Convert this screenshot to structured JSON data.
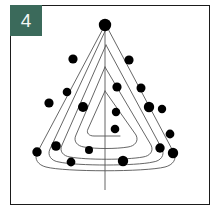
{
  "figure": {
    "index_badge": {
      "label": "4",
      "background_color": "#3b6a5b",
      "text_color": "#f4f7f5"
    },
    "canvas": {
      "background_color": "#ffffff",
      "border_color": "#1b1b1b",
      "width": 200,
      "height": 200
    },
    "stroke_color": "#555555",
    "dot_color": "#000000",
    "trunk": {
      "x": 95,
      "y_top": 20,
      "y_bottom": 185
    },
    "spiral_loops": [
      {
        "name": "outer-loop",
        "apex": [
          95,
          20
        ],
        "left_base": [
          28,
          150
        ],
        "right_base": [
          162,
          150
        ]
      },
      {
        "name": "second-loop",
        "apex": [
          95,
          40
        ],
        "left_base": [
          40,
          146
        ],
        "right_base": [
          150,
          146
        ]
      },
      {
        "name": "third-loop",
        "apex": [
          95,
          62
        ],
        "left_base": [
          52,
          140
        ],
        "right_base": [
          138,
          140
        ]
      },
      {
        "name": "inner-loop",
        "apex": [
          95,
          88
        ],
        "left_base": [
          66,
          132
        ],
        "right_base": [
          124,
          132
        ]
      }
    ],
    "ornaments": [
      {
        "cx": 95,
        "cy": 20,
        "r": 6.2
      },
      {
        "cx": 63,
        "cy": 54,
        "r": 4.6
      },
      {
        "cx": 119,
        "cy": 55,
        "r": 4.6
      },
      {
        "cx": 57,
        "cy": 87,
        "r": 4.3
      },
      {
        "cx": 131,
        "cy": 83,
        "r": 4.5
      },
      {
        "cx": 107,
        "cy": 82,
        "r": 4.6
      },
      {
        "cx": 39,
        "cy": 98,
        "r": 4.6
      },
      {
        "cx": 139,
        "cy": 102,
        "r": 5.2
      },
      {
        "cx": 152,
        "cy": 104,
        "r": 4.2
      },
      {
        "cx": 73,
        "cy": 102,
        "r": 5.0
      },
      {
        "cx": 106,
        "cy": 107,
        "r": 4.2
      },
      {
        "cx": 160,
        "cy": 129,
        "r": 4.4
      },
      {
        "cx": 105,
        "cy": 124,
        "r": 4.3
      },
      {
        "cx": 27,
        "cy": 147,
        "r": 4.7
      },
      {
        "cx": 46,
        "cy": 141,
        "r": 4.8
      },
      {
        "cx": 79,
        "cy": 145,
        "r": 4.0
      },
      {
        "cx": 150,
        "cy": 143,
        "r": 4.7
      },
      {
        "cx": 163,
        "cy": 148,
        "r": 5.2
      },
      {
        "cx": 61,
        "cy": 157,
        "r": 4.4
      },
      {
        "cx": 113,
        "cy": 156,
        "r": 5.2
      }
    ]
  }
}
